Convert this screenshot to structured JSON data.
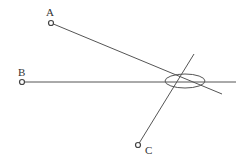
{
  "diagram": {
    "type": "geometry",
    "stroke_color": "#555555",
    "background": "#ffffff",
    "points": [
      {
        "id": "A",
        "label": "A",
        "x": 51,
        "y": 23,
        "label_x": 46,
        "label_y": 16
      },
      {
        "id": "B",
        "label": "B",
        "x": 22,
        "y": 82,
        "label_x": 18,
        "label_y": 76
      },
      {
        "id": "C",
        "label": "C",
        "x": 138,
        "y": 145,
        "label_x": 145,
        "label_y": 154
      }
    ],
    "lines": [
      {
        "from": "A",
        "x1": 51,
        "y1": 23,
        "x2": 222,
        "y2": 94
      },
      {
        "from": "B",
        "x1": 22,
        "y1": 82,
        "x2": 236,
        "y2": 82
      },
      {
        "from": "C",
        "x1": 138,
        "y1": 145,
        "x2": 194,
        "y2": 54
      }
    ],
    "ellipse": {
      "cx": 185,
      "cy": 81,
      "rx": 20,
      "ry": 7
    }
  }
}
